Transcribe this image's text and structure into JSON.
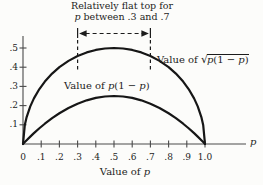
{
  "figure": {
    "background": "#fcfcfa",
    "ink": "#1c1c1c",
    "axis_color": "#4a4a4a",
    "annotation": {
      "line1": "Relatively flat top for",
      "line2_parts": [
        {
          "t": "p",
          "i": true
        },
        {
          "t": " between .3 and .7",
          "i": false
        }
      ],
      "p_from": 0.3,
      "p_to": 0.7
    },
    "labels": {
      "sqrt_curve": {
        "prefix": "Value of ",
        "radical": "√",
        "radicand_parts": [
          {
            "t": "p",
            "i": true
          },
          {
            "t": "(1 − ",
            "i": false
          },
          {
            "t": "p",
            "i": true
          },
          {
            "t": ")",
            "i": false
          }
        ]
      },
      "inner_curve_parts": [
        {
          "t": "Value of ",
          "i": false
        },
        {
          "t": "p",
          "i": true
        },
        {
          "t": "(1 − ",
          "i": false
        },
        {
          "t": "p",
          "i": true
        },
        {
          "t": ")",
          "i": false
        }
      ],
      "x_axis_title_parts": [
        {
          "t": "Value of ",
          "i": false
        },
        {
          "t": "p",
          "i": true
        }
      ],
      "x_end": "p"
    }
  },
  "chart_data": {
    "type": "line",
    "title": "",
    "xlabel": "Value of p",
    "ylabel": "",
    "xlim": [
      0,
      1.05
    ],
    "ylim": [
      0,
      0.55
    ],
    "grid": false,
    "legend_position": "none",
    "x_ticks": {
      "values": [
        0,
        0.1,
        0.2,
        0.3,
        0.4,
        0.5,
        0.6,
        0.7,
        0.8,
        0.9,
        1.0
      ],
      "labels": [
        "0",
        ".1",
        ".2",
        ".3",
        ".4",
        ".5",
        ".6",
        ".7",
        ".8",
        ".9",
        "1.0"
      ]
    },
    "y_ticks": {
      "values": [
        0.1,
        0.2,
        0.3,
        0.4,
        0.5
      ],
      "labels": [
        ".1",
        ".2",
        ".3",
        ".4",
        ".5"
      ]
    },
    "x": [
      0,
      0.01,
      0.02,
      0.04,
      0.06,
      0.09,
      0.12,
      0.16,
      0.2,
      0.25,
      0.3,
      0.35,
      0.4,
      0.45,
      0.5,
      0.55,
      0.6,
      0.65,
      0.7,
      0.75,
      0.8,
      0.84,
      0.88,
      0.91,
      0.94,
      0.96,
      0.98,
      0.99,
      1.0
    ],
    "series": [
      {
        "name": "Value of p(1 − p)",
        "values": [
          0,
          0.0099,
          0.0196,
          0.0384,
          0.0564,
          0.0819,
          0.1056,
          0.1344,
          0.16,
          0.1875,
          0.21,
          0.2275,
          0.24,
          0.2475,
          0.25,
          0.2475,
          0.24,
          0.2275,
          0.21,
          0.1875,
          0.16,
          0.1344,
          0.1056,
          0.0819,
          0.0564,
          0.0384,
          0.0196,
          0.0099,
          0
        ]
      },
      {
        "name": "Value of √p(1 − p)",
        "values": [
          0,
          0.0995,
          0.14,
          0.196,
          0.2375,
          0.2862,
          0.325,
          0.3666,
          0.4,
          0.433,
          0.4583,
          0.477,
          0.4899,
          0.4975,
          0.5,
          0.4975,
          0.4899,
          0.477,
          0.4583,
          0.433,
          0.4,
          0.3666,
          0.325,
          0.2862,
          0.2375,
          0.196,
          0.14,
          0.0995,
          0
        ]
      }
    ],
    "annotations": [
      "Relatively flat top for p between .3 and .7 (dashed double arrow spanning p = .3 to p = .7)"
    ]
  }
}
